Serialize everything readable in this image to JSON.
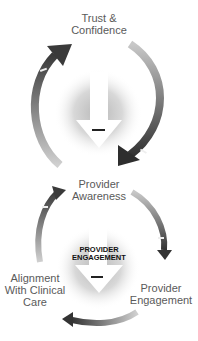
{
  "diagram": {
    "top_cycle": {
      "nodes": [
        {
          "label_line1": "Trust &",
          "label_line2": "Confidence"
        },
        {
          "label_line1": "Provider",
          "label_line2": "Awareness"
        }
      ],
      "center_arrow": {
        "direction": "down",
        "sign": "–"
      },
      "arrow_signs": [
        "–",
        "–"
      ]
    },
    "bottom_cycle": {
      "nodes": [
        {
          "label_line1": "Provider",
          "label_line2": "Awareness"
        },
        {
          "label_line1": "Provider",
          "label_line2": "Engagement"
        },
        {
          "label_line1": "Alignment",
          "label_line2": "With Clinical",
          "label_line3": "Care"
        }
      ],
      "center_arrow": {
        "direction": "down",
        "title_line1": "PROVIDER",
        "title_line2": "ENGAGEMENT",
        "sign": "–"
      },
      "arrow_signs": [
        "–",
        "–"
      ]
    },
    "colors": {
      "arrow_dark": "#3a3a3a",
      "arrow_light": "#9a9a9a",
      "glow": "#c8c8c8",
      "text": "#5a5a5a"
    }
  }
}
